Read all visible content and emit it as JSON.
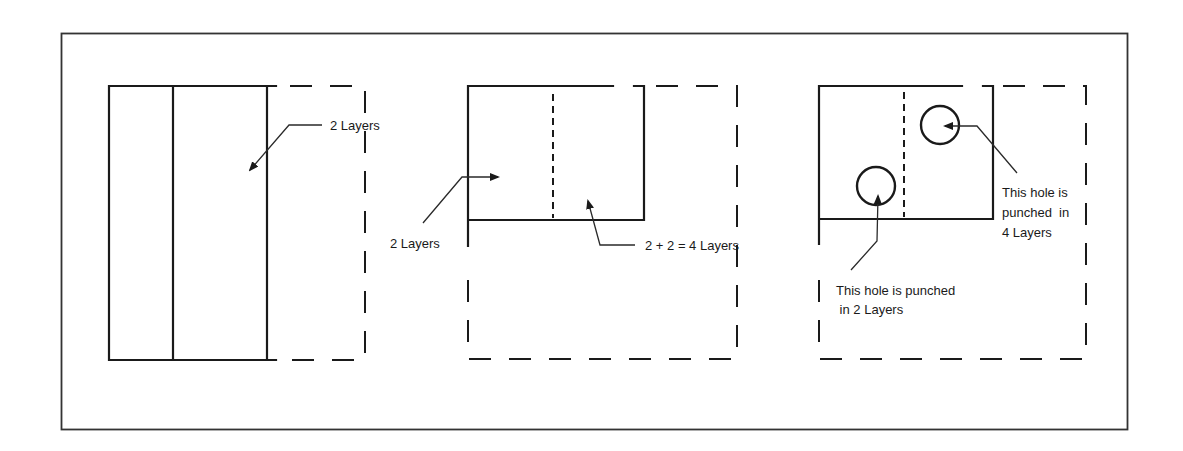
{
  "panels": [
    {
      "id": "panel-1",
      "labels": {
        "layers": "2 Layers"
      }
    },
    {
      "id": "panel-2",
      "labels": {
        "left_layers": "2 Layers",
        "overlap_layers": "2 + 2 = 4 Layers"
      }
    },
    {
      "id": "panel-3",
      "labels": {
        "hole_four_line1": "This hole is",
        "hole_four_line2": "punched  in",
        "hole_four_line3": "4 Layers",
        "hole_two_line1": "This hole is punched",
        "hole_two_line2": " in 2 Layers"
      }
    }
  ],
  "colors": {
    "stroke": "#1a1a1a",
    "background": "#ffffff"
  }
}
